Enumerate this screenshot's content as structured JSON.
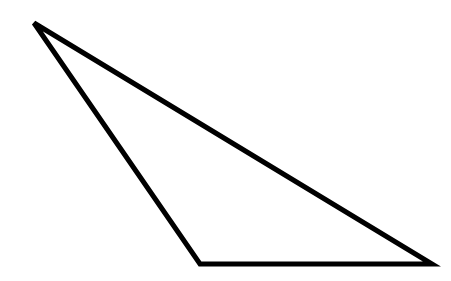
{
  "diagram": {
    "shape": "obtuse-triangle",
    "stroke_color": "#000000",
    "fill_color": "#ffffff",
    "stroke_width": 5,
    "vertices": [
      {
        "x": 34,
        "y": 23
      },
      {
        "x": 200,
        "y": 264
      },
      {
        "x": 432,
        "y": 264
      }
    ],
    "points": "34,23 200,264 432,264"
  }
}
